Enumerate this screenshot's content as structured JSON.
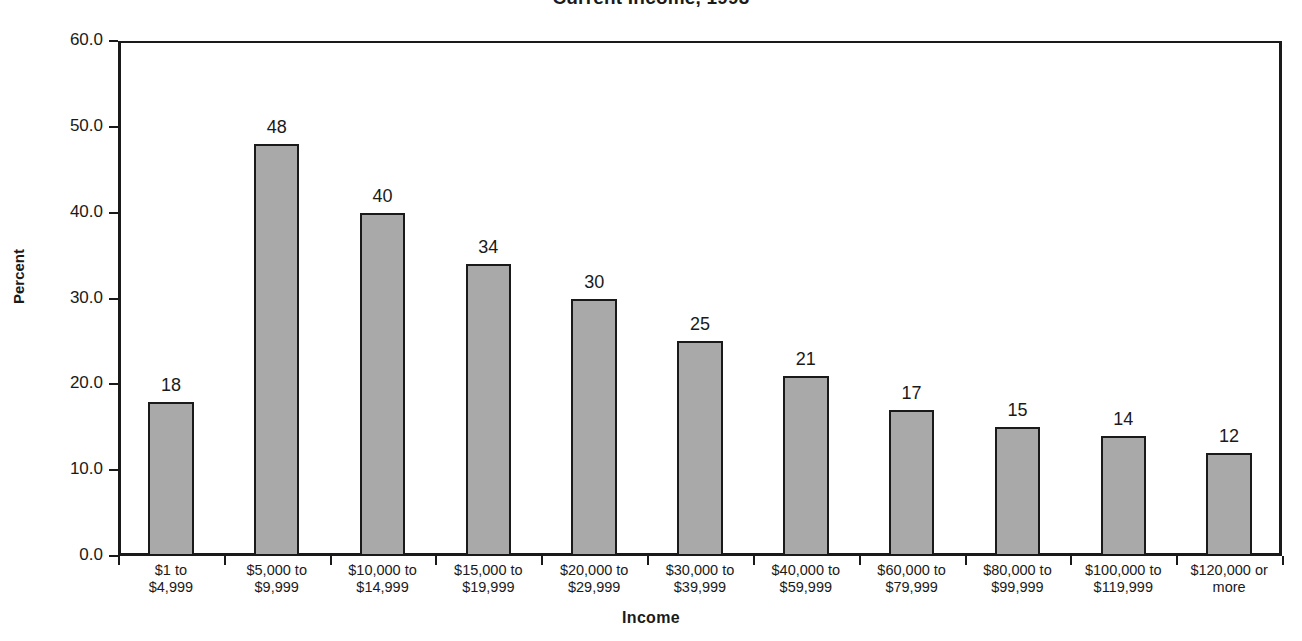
{
  "chart_data": {
    "type": "bar",
    "title": "Current Income, 1993",
    "xlabel": "Income",
    "ylabel": "Percent",
    "ylim": [
      0,
      60
    ],
    "yticks": [
      "0.0",
      "10.0",
      "20.0",
      "30.0",
      "40.0",
      "50.0",
      "60.0"
    ],
    "ytick_values": [
      0,
      10,
      20,
      30,
      40,
      50,
      60
    ],
    "grid": false,
    "legend": "none",
    "bar_color": "#a9a9a9",
    "bar_edge_color": "#1a1a1a",
    "categories": [
      "$1 to\n$4,999",
      "$5,000 to\n$9,999",
      "$10,000 to\n$14,999",
      "$15,000 to\n$19,999",
      "$20,000 to\n$29,999",
      "$30,000 to\n$39,999",
      "$40,000 to\n$59,999",
      "$60,000 to\n$79,999",
      "$80,000 to\n$99,999",
      "$100,000 to\n$119,999",
      "$120,000 or\nmore"
    ],
    "values": [
      18,
      48,
      40,
      34,
      30,
      25,
      21,
      17,
      15,
      14,
      12
    ],
    "value_labels": [
      "18",
      "48",
      "40",
      "34",
      "30",
      "25",
      "21",
      "17",
      "15",
      "14",
      "12"
    ]
  }
}
